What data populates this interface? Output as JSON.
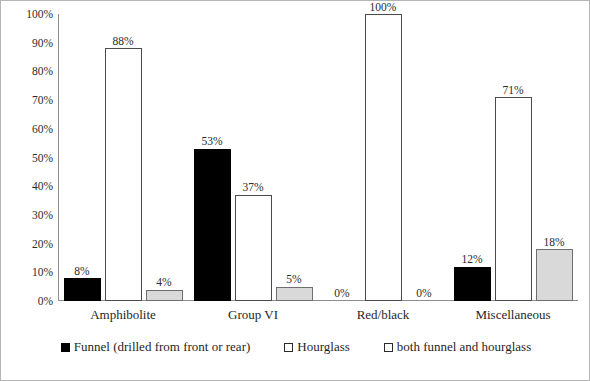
{
  "chart_data": {
    "type": "bar",
    "title": "",
    "subtitle": "",
    "xlabel": "",
    "ylabel": "",
    "ylim": [
      0,
      100
    ],
    "grid": false,
    "legend_position": "bottom",
    "value_suffix": "%",
    "categories": [
      "Amphibolite",
      "Group VI",
      "Red/black",
      "Miscellaneous"
    ],
    "y_ticks": [
      "0%",
      "10%",
      "20%",
      "30%",
      "40%",
      "50%",
      "60%",
      "70%",
      "80%",
      "90%",
      "100%"
    ],
    "y_tick_values": [
      0,
      10,
      20,
      30,
      40,
      50,
      60,
      70,
      80,
      90,
      100
    ],
    "series": [
      {
        "name": "Funnel (drilled from front or rear)",
        "key": "funnel",
        "color": "#000000",
        "border": "#000000",
        "values": [
          8,
          53,
          0,
          12
        ],
        "labels": [
          "8%",
          "53%",
          "0%",
          "12%"
        ]
      },
      {
        "name": "Hourglass",
        "key": "hourglass",
        "color": "#ffffff",
        "border": "#4a4a4a",
        "values": [
          88,
          37,
          100,
          71
        ],
        "labels": [
          "88%",
          "37%",
          "100%",
          "71%"
        ]
      },
      {
        "name": "both funnel and hourglass",
        "key": "both",
        "color": "#d9d9d9",
        "border": "#6e6e6e",
        "values": [
          4,
          5,
          0,
          18
        ],
        "labels": [
          "4%",
          "5%",
          "0%",
          "18%"
        ]
      }
    ]
  },
  "legend": {
    "items": [
      {
        "label": "Funnel (drilled from front or rear)",
        "swatch": "filled-black-square-icon"
      },
      {
        "label": "Hourglass",
        "swatch": "open-square-icon"
      },
      {
        "label": "both funnel and hourglass",
        "swatch": "open-square-icon"
      }
    ]
  }
}
